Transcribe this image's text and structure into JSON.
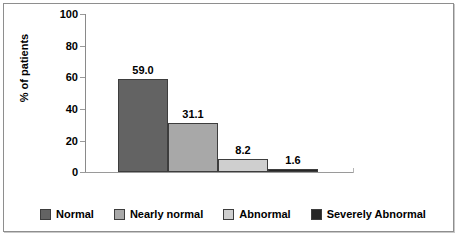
{
  "chart_data": {
    "type": "bar",
    "title": "",
    "xlabel": "",
    "ylabel": "% of patients",
    "ylim": [
      0,
      100
    ],
    "yticks": [
      "0",
      "20",
      "40",
      "60",
      "80",
      "100"
    ],
    "grid": false,
    "legend_position": "bottom",
    "categories": [
      "Normal",
      "Nearly normal",
      "Abnormal",
      "Severely Abnormal"
    ],
    "values": [
      59.0,
      31.1,
      8.2,
      1.6
    ],
    "data_labels": [
      "59.0",
      "31.1",
      "8.2",
      "1.6"
    ],
    "colors": [
      "#636363",
      "#a8a8a8",
      "#cfcfcf",
      "#262626"
    ]
  },
  "axis": {
    "y_title": "% of patients",
    "y_ticks": [
      {
        "label": "100",
        "value": 100
      },
      {
        "label": "80",
        "value": 80
      },
      {
        "label": "60",
        "value": 60
      },
      {
        "label": "40",
        "value": 40
      },
      {
        "label": "20",
        "value": 20
      },
      {
        "label": "0",
        "value": 0
      }
    ]
  },
  "bars": [
    {
      "name": "Normal",
      "label": "59.0",
      "value": 59.0,
      "color": "#636363"
    },
    {
      "name": "Nearly normal",
      "label": "31.1",
      "value": 31.1,
      "color": "#a8a8a8"
    },
    {
      "name": "Abnormal",
      "label": "8.2",
      "value": 8.2,
      "color": "#cfcfcf"
    },
    {
      "name": "Severely Abnormal",
      "label": "1.6",
      "value": 1.6,
      "color": "#262626"
    }
  ],
  "legend": {
    "items": [
      {
        "label": "Normal",
        "color": "#636363"
      },
      {
        "label": "Nearly normal",
        "color": "#a8a8a8"
      },
      {
        "label": "Abnormal",
        "color": "#cfcfcf"
      },
      {
        "label": "Severely Abnormal",
        "color": "#262626"
      }
    ]
  }
}
